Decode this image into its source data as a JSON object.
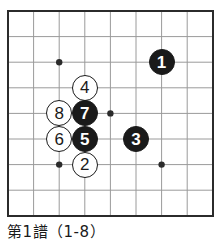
{
  "board": {
    "name": "go-board",
    "border_color": "#2b2b2b",
    "grid_color": "#9a9a9a",
    "background": "#ffffff",
    "left": 8,
    "top": 11,
    "right": 213,
    "bottom": 216,
    "spacing": 25.6,
    "columns": 9,
    "rows": 9,
    "star_points": [
      {
        "name": "star-point-top-left",
        "col": 2,
        "row": 2
      },
      {
        "name": "star-point-center",
        "col": 4,
        "row": 4
      },
      {
        "name": "star-point-bottom-left",
        "col": 2,
        "row": 6
      },
      {
        "name": "star-point-bottom-right",
        "col": 6,
        "row": 6
      }
    ]
  },
  "stones": [
    {
      "label": "1",
      "color": "black",
      "col": 6,
      "row": 2,
      "name": "stone-1-black"
    },
    {
      "label": "2",
      "color": "white",
      "col": 3,
      "row": 6,
      "name": "stone-2-white"
    },
    {
      "label": "3",
      "color": "black",
      "col": 5,
      "row": 5,
      "name": "stone-3-black"
    },
    {
      "label": "4",
      "color": "white",
      "col": 3,
      "row": 3,
      "name": "stone-4-white"
    },
    {
      "label": "5",
      "color": "black",
      "col": 3,
      "row": 5,
      "name": "stone-5-black"
    },
    {
      "label": "6",
      "color": "white",
      "col": 2,
      "row": 5,
      "name": "stone-6-white"
    },
    {
      "label": "7",
      "color": "black",
      "col": 3,
      "row": 4,
      "name": "stone-7-black"
    },
    {
      "label": "8",
      "color": "white",
      "col": 2,
      "row": 4,
      "name": "stone-8-white"
    }
  ],
  "caption": {
    "text": "第1譜（1-8）"
  }
}
